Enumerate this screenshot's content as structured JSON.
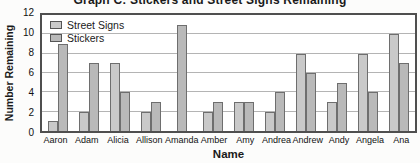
{
  "title": "Graph C: Stickers and Street Signs Remaining",
  "axes": {
    "y_label": "Number Remaining",
    "x_label": "Name",
    "y_ticks": [
      12,
      10,
      8,
      6,
      4,
      2,
      0
    ]
  },
  "legend": {
    "position": "top-left",
    "items": [
      {
        "label": "Street Signs",
        "color": "#c9c9c9"
      },
      {
        "label": "Stickers",
        "color": "#b9b9b9"
      }
    ]
  },
  "chart_data": {
    "type": "bar",
    "title": "Graph C: Stickers and Street Signs Remaining",
    "xlabel": "Name",
    "ylabel": "Number Remaining",
    "ylim": [
      0,
      12
    ],
    "ytick_step": 2,
    "grid": true,
    "legend_position": "top-left",
    "categories": [
      "Aaron",
      "Adam",
      "Alicia",
      "Allison",
      "Amanda",
      "Amber",
      "Amy",
      "Andrea",
      "Andrew",
      "Andy",
      "Angela",
      "Ana"
    ],
    "series": [
      {
        "name": "Street Signs",
        "color": "#c9c9c9",
        "values": [
          1,
          2,
          7,
          2,
          0,
          2,
          3,
          2,
          8,
          3,
          8,
          10
        ]
      },
      {
        "name": "Stickers",
        "color": "#b9b9b9",
        "values": [
          9,
          7,
          4,
          3,
          11,
          3,
          3,
          4,
          6,
          5,
          4,
          7
        ]
      }
    ]
  },
  "colors": {
    "plot_border": "#4f4f4f",
    "gridline": "#b4b4b4",
    "bar_border": "#6e6e6e",
    "background": "#ffffff"
  }
}
